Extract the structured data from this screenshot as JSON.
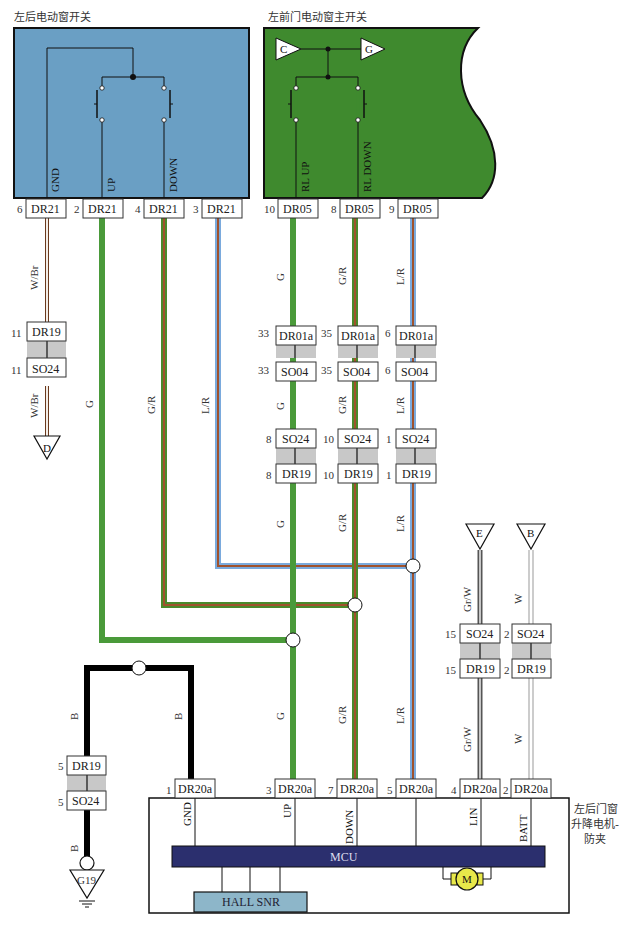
{
  "title_left_switch": "左后电动窗开关",
  "title_main_switch": "左前门电动窗主开关",
  "motor_module_label_1": "左后门窗",
  "motor_module_label_2": "升降电机-",
  "motor_module_label_3": "防夹",
  "colors": {
    "left_switch_fill": "#6a9fc4",
    "main_switch_fill": "#3f8a2e",
    "wire_G": "#4a9a3a",
    "wire_GR_base": "#4a8a2a",
    "wire_GR_stripe": "#a0522d",
    "wire_LR_base": "#7aaadd",
    "wire_LR_stripe": "#a0522d",
    "wire_B": "#000000",
    "mcu_fill": "#2b2f6e",
    "hall_fill": "#8db6c9",
    "motor_fill": "#e8e84a"
  },
  "left_switch": {
    "signals": [
      "GND",
      "UP",
      "DOWN"
    ],
    "connectors": [
      {
        "pin": "6",
        "name": "DR21"
      },
      {
        "pin": "2",
        "name": "DR21"
      },
      {
        "pin": "4",
        "name": "DR21"
      },
      {
        "pin": "3",
        "name": "DR21"
      }
    ]
  },
  "main_switch": {
    "refs": [
      "C",
      "G"
    ],
    "signals": [
      "RL UP",
      "RL DOWN"
    ],
    "connectors": [
      {
        "pin": "10",
        "name": "DR05"
      },
      {
        "pin": "8",
        "name": "DR05"
      },
      {
        "pin": "9",
        "name": "DR05"
      }
    ]
  },
  "wire_labels": {
    "wbr": "W/Br",
    "g": "G",
    "gr": "G/R",
    "lr": "L/R",
    "grw": "Gr/W",
    "w": "W",
    "b": "B"
  },
  "inline_connectors": {
    "gnd_upper": {
      "pin": "11",
      "name": "DR19"
    },
    "gnd_lower": {
      "pin": "11",
      "name": "SO24"
    },
    "rlup_1_upper": {
      "pin": "33",
      "name": "DR01a"
    },
    "rlup_1_lower": {
      "pin": "33",
      "name": "SO04"
    },
    "rldn_1_upper": {
      "pin": "35",
      "name": "DR01a"
    },
    "rldn_1_lower": {
      "pin": "35",
      "name": "SO04"
    },
    "lr_1_upper": {
      "pin": "6",
      "name": "DR01a"
    },
    "lr_1_lower": {
      "pin": "6",
      "name": "SO04"
    },
    "rlup_2_upper": {
      "pin": "8",
      "name": "SO24"
    },
    "rlup_2_lower": {
      "pin": "8",
      "name": "DR19"
    },
    "rldn_2_upper": {
      "pin": "10",
      "name": "SO24"
    },
    "rldn_2_lower": {
      "pin": "10",
      "name": "DR19"
    },
    "lr_2_upper": {
      "pin": "1",
      "name": "SO24"
    },
    "lr_2_lower": {
      "pin": "1",
      "name": "DR19"
    },
    "e_upper": {
      "pin": "15",
      "name": "SO24"
    },
    "e_lower": {
      "pin": "15",
      "name": "DR19"
    },
    "b_upper": {
      "pin": "2",
      "name": "SO24"
    },
    "b_lower": {
      "pin": "2",
      "name": "DR19"
    },
    "gnd2_upper": {
      "pin": "5",
      "name": "DR19"
    },
    "gnd2_lower": {
      "pin": "5",
      "name": "SO24"
    }
  },
  "refs": {
    "d": "D",
    "e": "E",
    "b": "B",
    "ground": "G19"
  },
  "motor_module": {
    "connectors": [
      {
        "pin": "1",
        "name": "DR20a",
        "signal": "GND"
      },
      {
        "pin": "3",
        "name": "DR20a",
        "signal": "UP"
      },
      {
        "pin": "7",
        "name": "DR20a",
        "signal": "DOWN"
      },
      {
        "pin": "5",
        "name": "DR20a",
        "signal": ""
      },
      {
        "pin": "4",
        "name": "DR20a",
        "signal": "LIN"
      },
      {
        "pin": "2",
        "name": "DR20a",
        "signal": "BATT"
      }
    ],
    "mcu": "MCU",
    "hall": "HALL SNR",
    "motor": "M"
  }
}
